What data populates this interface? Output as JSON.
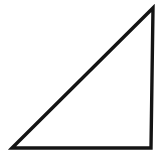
{
  "figure": {
    "name": "right-triangle-figure",
    "title": "Right triangle",
    "type": "line-drawing",
    "background_color": "#ffffff",
    "canvas": {
      "width": 164,
      "height": 158
    },
    "shape": {
      "name": "right-triangle",
      "kind": "triangle",
      "orientation": "right angle at bottom-right",
      "fill": "none",
      "stroke_color": "#141414",
      "stroke_width": 3.4,
      "vertices": [
        {
          "label": "bottom-left",
          "x": 12,
          "y": 148
        },
        {
          "label": "top-right",
          "x": 153,
          "y": 8
        },
        {
          "label": "bottom-right",
          "x": 151,
          "y": 148
        }
      ],
      "points_attr": "12,148 153,8 151,148",
      "edges": [
        {
          "name": "hypotenuse",
          "from": "bottom-left",
          "to": "top-right"
        },
        {
          "name": "vertical-leg",
          "from": "top-right",
          "to": "bottom-right"
        },
        {
          "name": "horizontal-leg",
          "from": "bottom-right",
          "to": "bottom-left"
        }
      ]
    }
  }
}
